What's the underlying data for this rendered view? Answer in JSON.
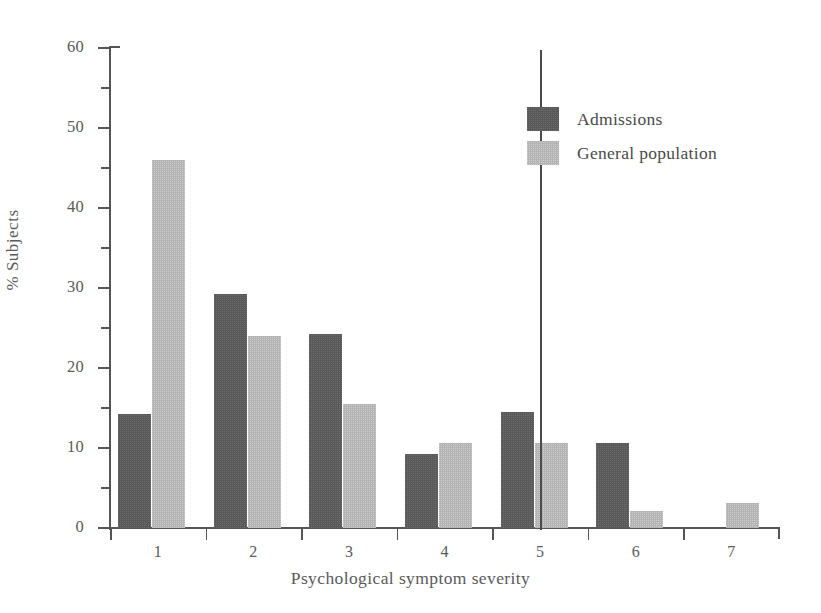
{
  "chart_data": {
    "type": "bar",
    "title": "",
    "subtitle": "",
    "xlabel": "Psychological symptom severity",
    "ylabel": "% Subjects",
    "categories": [
      "1",
      "2",
      "3",
      "4",
      "5",
      "6",
      "7"
    ],
    "series": [
      {
        "name": "Admissions",
        "color": "#5a5a5a",
        "values": [
          14.3,
          29.3,
          24.3,
          9.3,
          14.5,
          10.6,
          0
        ]
      },
      {
        "name": "General population",
        "color": "#b3b3b3",
        "values": [
          46.0,
          24.0,
          15.5,
          10.6,
          10.6,
          2.1,
          3.1
        ]
      }
    ],
    "ylim": [
      0,
      60
    ],
    "y_major_ticks": [
      0,
      10,
      20,
      30,
      40,
      50,
      60
    ],
    "y_minor_ticks": [
      5,
      15,
      25,
      35,
      45,
      55
    ],
    "y_tick_labels": [
      "0",
      "10",
      "20",
      "30",
      "40",
      "50",
      "60"
    ],
    "grid": false,
    "legend_position": "top-right-inside",
    "annotations": [
      {
        "name": "category-divider",
        "type": "vertical-line",
        "between_categories": [
          "4",
          "5"
        ],
        "x_value": 4.5
      }
    ]
  },
  "axes": {
    "y_title": "% Subjects",
    "x_title": "Psychological symptom severity"
  },
  "legend": {
    "entries": [
      {
        "label": "Admissions",
        "color": "#5a5a5a"
      },
      {
        "label": "General population",
        "color": "#b3b3b3"
      }
    ]
  }
}
